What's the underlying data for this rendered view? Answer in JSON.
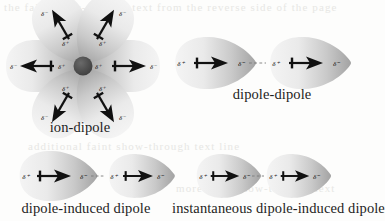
{
  "figure": {
    "background_color": "#fdfdfc",
    "ink_color": "#1a1a1a",
    "ion_color": "#4d4d4d",
    "lobe_color_light": "#f1f1f1",
    "lobe_color_dark": "#a8a8a8",
    "ghost_text_color": "#e7e7e4"
  },
  "symbols": {
    "delta_plus": "δ⁺",
    "delta_minus": "δ⁻",
    "dash": "- - - -"
  },
  "panels": [
    {
      "id": "ion-dipole",
      "caption": "ion-dipole",
      "center_particle": "ion",
      "dipole_count": 6,
      "dipole_orientation": "pointing away from central ion",
      "inner_label": "δ⁺",
      "outer_label": "δ⁻"
    },
    {
      "id": "dipole-dipole",
      "caption": "dipole-dipole",
      "molecule_count": 2,
      "left_labels": [
        "δ⁺",
        "δ⁻"
      ],
      "right_labels": [
        "δ⁺",
        "δ⁻"
      ],
      "connector": "- - - -"
    },
    {
      "id": "dipole-induced-dipole",
      "caption": "dipole-induced dipole",
      "molecule_count": 2,
      "left_labels": [
        "δ⁺",
        "δ⁻"
      ],
      "right_labels": [
        "δ⁺",
        "δ⁻"
      ],
      "connector": "- - - -"
    },
    {
      "id": "instantaneous-dipole-induced-dipole",
      "caption": "instantaneous dipole-induced dipole",
      "molecule_count": 2,
      "left_labels": [
        "δ⁺",
        "δ⁻"
      ],
      "right_labels": [
        "δ⁺",
        "δ⁻"
      ],
      "connector": "- - - -"
    }
  ],
  "ghost_text": {
    "top": "the faint show-through text from the reverse side of the page",
    "middle": "additional faint show-through text line",
    "middle2": "more faint show-through text"
  }
}
